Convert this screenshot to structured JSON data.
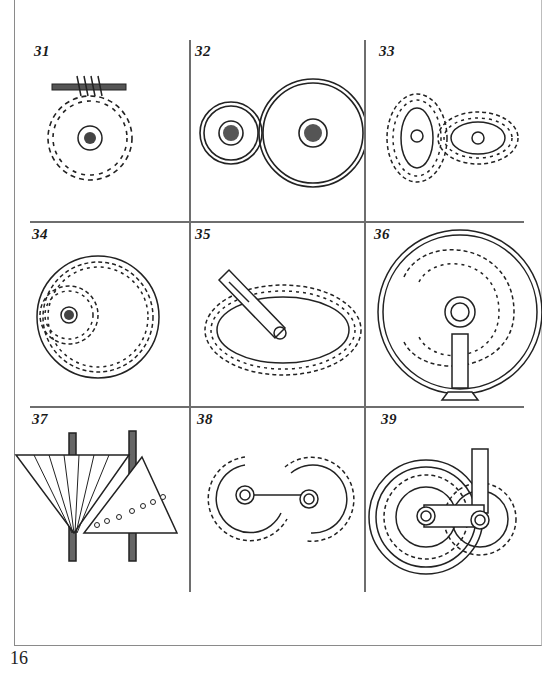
{
  "page": {
    "page_number": "16",
    "layout": "3x3 grid of numbered mechanical gear illustrations"
  },
  "figures": [
    {
      "number": "31",
      "description": "Worm gear driving a spur wheel"
    },
    {
      "number": "32",
      "description": "Two friction wheels (plain discs) in contact"
    },
    {
      "number": "33",
      "description": "Pair of elliptical toothed gears"
    },
    {
      "number": "34",
      "description": "Internal ring gear with small pinion"
    },
    {
      "number": "35",
      "description": "Elliptical gear with pinion on slotted arm"
    },
    {
      "number": "36",
      "description": "Spiral/scroll internal gear track with pinion on stand"
    },
    {
      "number": "37",
      "description": "Conical drum with pins driven by fluted cone"
    },
    {
      "number": "38",
      "description": "Two sector gears connected by link"
    },
    {
      "number": "39",
      "description": "Segmented ring gear with pinion and crank link"
    }
  ],
  "colors": {
    "ink": "#1a1a1a",
    "rule": "#6e6e6e",
    "paper": "#ffffff"
  }
}
